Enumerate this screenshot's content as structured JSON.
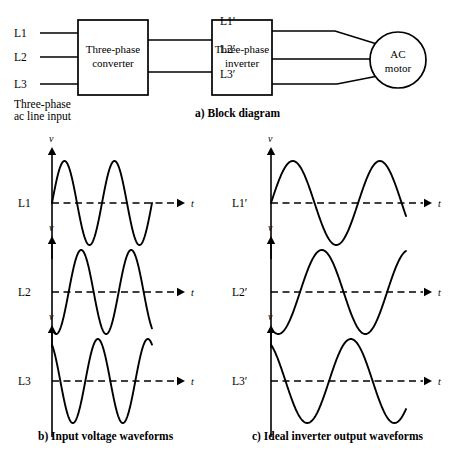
{
  "figure": {
    "block_diagram": {
      "caption": "a)  Block diagram",
      "inputs": [
        {
          "label": "L1"
        },
        {
          "label": "L2"
        },
        {
          "label": "L3"
        }
      ],
      "input_note_line1": "Three-phase",
      "input_note_line2": "ac line input",
      "converter": {
        "line1": "Three-phase",
        "line2": "converter"
      },
      "inverter": {
        "line1": "Three-phase",
        "line2": "inverter"
      },
      "outputs": [
        {
          "label": "L1′"
        },
        {
          "label": "L2′"
        },
        {
          "label": "L3′"
        }
      ],
      "motor": {
        "line1": "AC",
        "line2": "motor"
      }
    },
    "input_waveforms": {
      "caption": "b)  Input voltage waveforms",
      "axis_v": "v",
      "axis_t": "t",
      "plots": [
        {
          "label": "L1",
          "phase_deg": 0
        },
        {
          "label": "L2",
          "phase_deg": -120
        },
        {
          "label": "L3",
          "phase_deg": 120
        }
      ]
    },
    "output_waveforms": {
      "caption": "c)  Ideal inverter output waveforms",
      "axis_v": "v",
      "axis_t": "t",
      "plots": [
        {
          "label": "L1′",
          "phase_deg": 0
        },
        {
          "label": "L2′",
          "phase_deg": -120
        },
        {
          "label": "L3′",
          "phase_deg": 120
        }
      ]
    }
  },
  "chart_data": {
    "type": "line",
    "xlabel": "t",
    "ylabel": "v",
    "grid": false,
    "legend": "none",
    "panels": [
      {
        "name": "b) Input voltage waveforms",
        "cycles": 2.0,
        "amplitude": 1.0,
        "series": [
          {
            "name": "L1",
            "phase_deg": 0
          },
          {
            "name": "L2",
            "phase_deg": -120
          },
          {
            "name": "L3",
            "phase_deg": 120
          }
        ]
      },
      {
        "name": "c) Ideal inverter output waveforms",
        "cycles": 1.55,
        "amplitude": 1.0,
        "series": [
          {
            "name": "L1′",
            "phase_deg": 0
          },
          {
            "name": "L2′",
            "phase_deg": -120
          },
          {
            "name": "L3′",
            "phase_deg": 120
          }
        ]
      }
    ]
  },
  "geometry": {
    "left_plots": {
      "axis_x": 52,
      "wave_end": 152,
      "dash_end": 185,
      "amp": 42,
      "cycles": 2.0,
      "baselines": [
        203,
        292,
        381
      ],
      "label_x": 18
    },
    "right_plots": {
      "axis_x": 271,
      "wave_end": 406,
      "dash_end": 432,
      "amp": 42,
      "cycles": 1.55,
      "baselines": [
        203,
        292,
        381
      ],
      "label_x": 232
    }
  }
}
